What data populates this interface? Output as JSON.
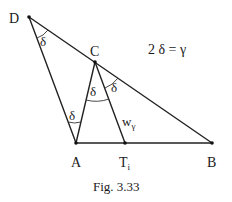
{
  "figure": {
    "caption": "Fig. 3.33",
    "equation": "2 δ = γ",
    "points": {
      "D": {
        "label": "D",
        "x": 29,
        "y": 17
      },
      "C": {
        "label": "C",
        "x": 95,
        "y": 62
      },
      "A": {
        "label": "A",
        "x": 76,
        "y": 143
      },
      "T": {
        "label": "T",
        "sub": "i",
        "x": 125,
        "y": 143
      },
      "B": {
        "label": "B",
        "x": 212,
        "y": 143
      }
    },
    "angle_labels": {
      "at_D": "δ",
      "at_C_left": "δ",
      "at_C_right": "δ",
      "at_A": "δ"
    },
    "segment_label": {
      "text": "w",
      "sub": "γ"
    }
  },
  "colors": {
    "stroke": "#222222",
    "background": "#ffffff"
  }
}
